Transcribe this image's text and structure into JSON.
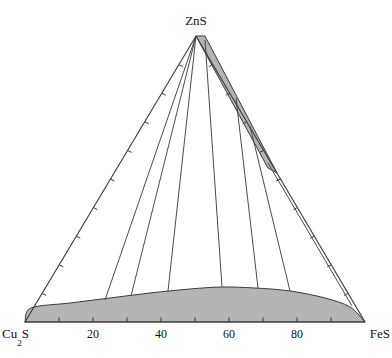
{
  "figure": {
    "type": "ternary-phase-diagram",
    "background_color": "#ffffff",
    "line_color": "#3a3a3a",
    "fill_color": "#b4b4b4",
    "text_color": "#111111"
  },
  "vertices": {
    "top": {
      "label": "ZnS",
      "sub": "",
      "tail": ""
    },
    "left": {
      "label": "Cu",
      "sub": "2",
      "tail": "S"
    },
    "right": {
      "label": "FeS",
      "sub": "",
      "tail": ""
    }
  },
  "bottom_axis": {
    "tick_labels": [
      "20",
      "40",
      "60",
      "80"
    ],
    "tick_values": [
      20,
      40,
      60,
      80
    ],
    "tick_interval": 10,
    "minor_ticks": [
      10,
      20,
      30,
      40,
      50,
      60,
      70,
      80,
      90
    ]
  },
  "chart_data": {
    "type": "scatter",
    "title": "",
    "subtitle": "",
    "xlabel": "",
    "ylabel": "",
    "grid": false,
    "legend": "none",
    "axes": {
      "left_vertex_label": "Cu2S",
      "right_vertex_label": "FeS",
      "top_vertex_label": "ZnS",
      "bottom_tick_labels": [
        "20",
        "40",
        "60",
        "80"
      ],
      "tick_interval": 10,
      "range": [
        0,
        100
      ]
    },
    "geometry_px": {
      "apex": [
        196,
        36
      ],
      "left_corner": [
        25,
        322
      ],
      "right_corner": [
        365,
        322
      ]
    },
    "regions": [
      {
        "name": "zns-fes-wedge",
        "description": "narrow shaded two-phase wedge along the ZnS-FeS edge",
        "fill": "#b4b4b4",
        "outline_px": [
          [
            196,
            36
          ],
          [
            205,
            36
          ],
          [
            277,
            173
          ],
          [
            268,
            168
          ]
        ]
      },
      {
        "name": "cu2s-fes-liquid-band",
        "description": "curved shaded band along the Cu2S-FeS base",
        "fill": "#b4b4b4",
        "boundary_px": [
          [
            25,
            322
          ],
          [
            31,
            308
          ],
          [
            70,
            303
          ],
          [
            110,
            298
          ],
          [
            150,
            293
          ],
          [
            190,
            289
          ],
          [
            222,
            287
          ],
          [
            255,
            288
          ],
          [
            290,
            291
          ],
          [
            325,
            298
          ],
          [
            350,
            307
          ],
          [
            365,
            322
          ]
        ]
      }
    ],
    "tie_lines_px": [
      [
        [
          196,
          36
        ],
        [
          105,
          300
        ]
      ],
      [
        [
          196,
          36
        ],
        [
          131,
          296
        ]
      ],
      [
        [
          196,
          36
        ],
        [
          168,
          291
        ]
      ],
      [
        [
          205,
          40
        ],
        [
          222,
          287
        ]
      ],
      [
        [
          236,
          98
        ],
        [
          258,
          288
        ]
      ],
      [
        [
          250,
          126
        ],
        [
          290,
          291
        ]
      ],
      [
        [
          268,
          163
        ],
        [
          352,
          306
        ]
      ]
    ],
    "edge_ticks": {
      "bottom": [
        10,
        20,
        30,
        40,
        50,
        60,
        70,
        80,
        90
      ],
      "left": [
        10,
        20,
        30,
        40,
        50,
        60,
        70,
        80,
        90
      ],
      "right": [
        10,
        20,
        30,
        40,
        50,
        60,
        70,
        80,
        90
      ]
    }
  }
}
